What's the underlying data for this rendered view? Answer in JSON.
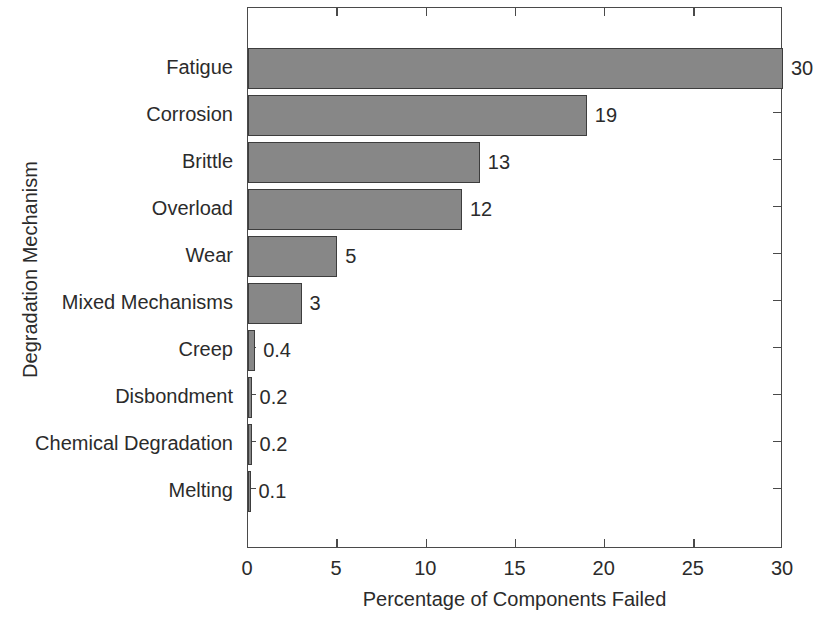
{
  "chart_data": {
    "type": "bar",
    "orientation": "horizontal",
    "title": "",
    "xlabel": "Percentage of Components Failed",
    "ylabel": "Degradation Mechanism",
    "categories": [
      "Fatigue",
      "Corrosion",
      "Brittle",
      "Overload",
      "Wear",
      "Mixed Mechanisms",
      "Creep",
      "Disbondment",
      "Chemical Degradation",
      "Melting"
    ],
    "values": [
      30,
      19,
      13,
      12,
      5,
      3,
      0.4,
      0.2,
      0.2,
      0.1
    ],
    "value_labels": [
      "30",
      "19",
      "13",
      "12",
      "5",
      "3",
      "0.4",
      "0.2",
      "0.2",
      "0.1"
    ],
    "xlim": [
      0,
      30
    ],
    "xticks": [
      0,
      5,
      10,
      15,
      20,
      25,
      30
    ],
    "xtick_labels": [
      "0",
      "5",
      "10",
      "15",
      "20",
      "25",
      "30"
    ],
    "grid": false,
    "legend": false,
    "bar_fill_color": "#878787",
    "bar_edge_color": "#3d3d3d",
    "axis_color": "#4a4a4a",
    "background_color": "#ffffff",
    "text_color": "#2b2b2b"
  }
}
